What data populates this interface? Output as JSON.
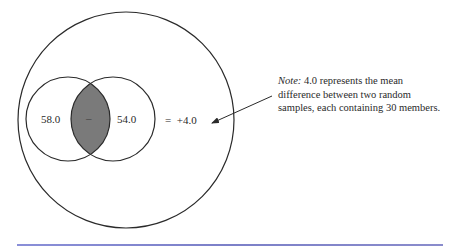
{
  "diagram": {
    "left_circle_value": "58.0",
    "right_circle_value": "54.0",
    "overlap_symbol": "–",
    "result": "=  +4.0",
    "note": {
      "label": "Note:",
      "lines": [
        " 4.0 represents the mean",
        "difference between two random",
        "samples, each containing 30 members."
      ]
    },
    "colors": {
      "stroke": "#2a2a2a",
      "overlap_fill": "#7a7a7a",
      "rule": "#7c80c8"
    }
  }
}
